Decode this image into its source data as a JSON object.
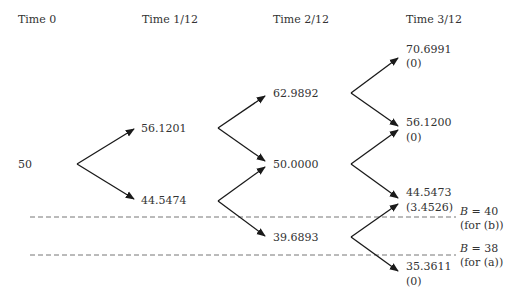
{
  "headers": [
    "Time 0",
    "Time 1/12",
    "Time 2/12",
    "Time 3/12"
  ],
  "nodes": {
    "t0": "50",
    "t1_up": "56.1201",
    "t1_down": "44.5474",
    "t2_up": "62.9892",
    "t2_mid": "50.0000",
    "t2_down": "39.6893",
    "t3_uu": {
      "price": "70.6991",
      "payoff": "(0)"
    },
    "t3_u": {
      "price": "56.1200",
      "payoff": "(0)"
    },
    "t3_d": {
      "price": "44.5473",
      "payoff": "(3.4526)"
    },
    "t3_dd": {
      "price": "35.3611",
      "payoff": "(0)"
    }
  },
  "barriers": [
    {
      "var": "B",
      "eq": " = 40",
      "note": "(for (b))"
    },
    {
      "var": "B",
      "eq": " = 38",
      "note": "(for (a))"
    }
  ],
  "colors": {
    "line": "#1a1a1a",
    "dashed": "#777777",
    "text": "#333333"
  }
}
